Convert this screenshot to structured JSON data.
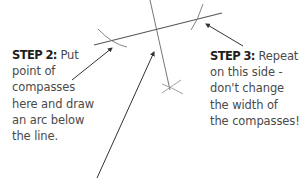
{
  "diagram": {
    "colors": {
      "line": "#555555",
      "arrow": "#333333",
      "text": "#4a4a4a",
      "step_text": "#1e1e1e"
    },
    "step2": {
      "heading": "STEP 2:",
      "lines": [
        "Put",
        "point of",
        "compasses",
        "here and draw",
        "an arc below",
        "the line."
      ]
    },
    "step3": {
      "heading": "STEP 3:",
      "lines": [
        "Repeat",
        "on this side -",
        "don't change",
        "the width of",
        "the compasses!"
      ]
    }
  }
}
